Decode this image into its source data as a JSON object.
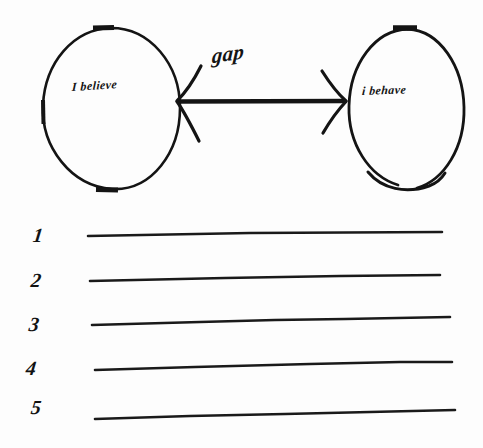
{
  "diagram": {
    "title_text_present": false,
    "background_color": "#fdfdfd",
    "ink_color": "#141414",
    "nodes": [
      {
        "id": "believe",
        "label": "I believe",
        "shape": "oval",
        "x": 42,
        "y": 27,
        "width": 138,
        "height": 163
      },
      {
        "id": "behave",
        "label": "i behave",
        "shape": "oval",
        "x": 348,
        "y": 28,
        "width": 117,
        "height": 162
      }
    ],
    "connector": {
      "label": "gap",
      "style": "double-headed-arrow",
      "from": "believe",
      "to": "behave"
    },
    "lines": [
      {
        "number": "1"
      },
      {
        "number": "2"
      },
      {
        "number": "3"
      },
      {
        "number": "4"
      },
      {
        "number": "5"
      }
    ]
  }
}
